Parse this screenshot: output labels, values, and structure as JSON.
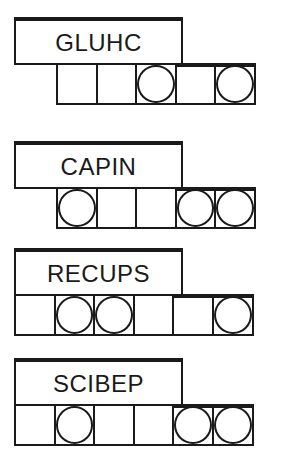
{
  "puzzles": [
    {
      "scrambled_word": "GLUHC",
      "cells_start_index": 1,
      "total_slots": 6,
      "circled_cells": [
        3,
        5
      ],
      "highlighted_cells": [
        4,
        5
      ]
    },
    {
      "scrambled_word": "CAPIN",
      "cells_start_index": 1,
      "total_slots": 6,
      "circled_cells": [
        1,
        4,
        5
      ],
      "highlighted_cells": [
        4,
        5
      ]
    },
    {
      "scrambled_word": "RECUPS",
      "cells_start_index": 0,
      "total_slots": 6,
      "circled_cells": [
        1,
        2,
        5
      ],
      "highlighted_cells": [
        4,
        5
      ]
    },
    {
      "scrambled_word": "SCIBEP",
      "cells_start_index": 0,
      "total_slots": 6,
      "circled_cells": [
        1,
        4,
        5
      ],
      "highlighted_cells": [
        4,
        5
      ]
    }
  ]
}
